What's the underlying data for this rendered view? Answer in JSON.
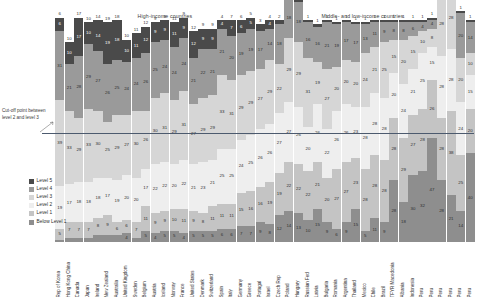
{
  "headers": {
    "high_income": "High-income countries",
    "mid_low_income": "Middle- and low-income countries"
  },
  "annotation": {
    "cutoff_text": "Cut-off point between level 2 and level 3"
  },
  "legend": {
    "position": "left-below-plot",
    "items": [
      {
        "label": "Level 5",
        "color": "#4a4a4a"
      },
      {
        "label": "Level 4",
        "color": "#9a9a9a"
      },
      {
        "label": "Level 3",
        "color": "#d6d6d6"
      },
      {
        "label": "Level 2",
        "color": "#eeeeee"
      },
      {
        "label": "Level 1",
        "color": "#c4c4c4"
      },
      {
        "label": "Below Level 1",
        "color": "#8e8e8e"
      }
    ]
  },
  "chart_data": {
    "type": "bar",
    "title": "",
    "xlabel": "",
    "ylabel": "",
    "stacked": true,
    "orientation": "vertical",
    "grid": false,
    "ylim": [
      0,
      100
    ],
    "groups": [
      {
        "name": "High-income countries",
        "start": 0,
        "count": 27
      },
      {
        "name": "Middle- and low-income countries",
        "start": 27,
        "count": 17
      }
    ],
    "series": [
      {
        "name": "Level 5",
        "color": "#4a4a4a",
        "values": [
          6,
          10,
          17,
          10,
          14,
          19,
          18,
          10,
          11,
          12,
          9,
          9,
          11,
          9,
          12,
          9,
          9,
          4,
          7,
          6,
          5,
          3,
          4,
          2,
          2,
          2,
          1,
          1,
          1,
          1,
          1,
          1,
          1,
          1,
          1,
          1,
          1,
          1,
          1,
          1,
          1,
          1,
          1,
          1
        ]
      },
      {
        "name": "Level 4",
        "color": "#9a9a9a",
        "values": [
          31,
          21,
          28,
          29,
          27,
          26,
          25,
          24,
          24,
          26,
          25,
          24,
          24,
          24,
          21,
          22,
          21,
          21,
          20,
          19,
          19,
          17,
          14,
          18,
          18,
          18,
          16,
          16,
          21,
          19,
          17,
          17,
          13,
          11,
          9,
          8,
          8,
          6,
          4,
          4,
          15,
          20,
          20,
          14
        ]
      },
      {
        "name": "Level 3",
        "color": "#d6d6d6",
        "values": [
          39,
          33,
          29,
          33,
          30,
          25,
          29,
          27,
          30,
          26,
          30,
          31,
          29,
          31,
          27,
          29,
          29,
          33,
          31,
          29,
          29,
          27,
          29,
          22,
          29,
          29,
          31,
          19,
          27,
          20,
          20,
          20,
          24,
          21,
          25,
          15,
          20,
          15,
          10,
          8,
          28,
          28,
          20,
          10
        ]
      },
      {
        "name": "Level 2",
        "color": "#eeeeee",
        "values": [
          19,
          17,
          18,
          18,
          18,
          17,
          19,
          20,
          20,
          17,
          22,
          22,
          20,
          22,
          21,
          23,
          21,
          25,
          25,
          24,
          25,
          26,
          26,
          27,
          27,
          26,
          20,
          26,
          22,
          26,
          26,
          23,
          28,
          28,
          28,
          20,
          24,
          21,
          25,
          15,
          28,
          28,
          24,
          15
        ]
      },
      {
        "name": "Level 1",
        "color": "#c4c4c4",
        "values": [
          5,
          7,
          7,
          7,
          8,
          9,
          6,
          6,
          7,
          11,
          9,
          9,
          10,
          11,
          9,
          8,
          11,
          11,
          11,
          15,
          16,
          16,
          19,
          19,
          22,
          22,
          22,
          21,
          20,
          27,
          27,
          23,
          28,
          28,
          28,
          28,
          29,
          27,
          28,
          26,
          28,
          38,
          25,
          20
        ]
      },
      {
        "name": "Below Level 1",
        "color": "#8e8e8e",
        "values": [
          1,
          2,
          2,
          2,
          3,
          3,
          3,
          4,
          2,
          5,
          4,
          5,
          5,
          4,
          5,
          5,
          5,
          6,
          6,
          7,
          7,
          9,
          8,
          12,
          14,
          13,
          10,
          15,
          9,
          6,
          9,
          15,
          5,
          11,
          9,
          28,
          18,
          30,
          32,
          47,
          28,
          21,
          14,
          40
        ]
      }
    ],
    "top_labels": [
      6,
      10,
      17,
      10,
      14,
      19,
      18,
      10,
      11,
      12,
      9,
      9,
      11,
      9,
      12,
      9,
      9,
      4,
      7,
      6,
      5,
      3,
      4,
      2,
      2,
      2,
      1,
      1,
      1,
      1,
      1,
      1,
      1,
      1,
      1,
      1,
      1,
      1,
      1,
      1,
      1,
      1,
      1,
      1
    ],
    "categories": [
      "Rep of Korea",
      "Hong Kong China",
      "Canada",
      "Japan",
      "Ireland",
      "New Zealand",
      "Australia",
      "United Kingdom",
      "Sweden",
      "Belgium",
      "Austria",
      "Iceland",
      "Norway",
      "France",
      "United States",
      "Denmark",
      "Switzerland",
      "Spain",
      "Italy",
      "Germany",
      "Greece",
      "Portugal",
      "Israel",
      "Czech Rep",
      "Poland",
      "Hungary",
      "Russian Fed",
      "Latvia",
      "Bulgaria",
      "Romania",
      "Argentina",
      "Thailand",
      "Mexico",
      "Chile",
      "Brazil",
      "TFYR Macedonia",
      "Albania",
      "Indonesia",
      "Peru",
      "Peru",
      "Peru",
      "Peru",
      "Peru",
      "Peru"
    ],
    "annotations": [
      "Cut-off point between level 2 and level 3"
    ]
  }
}
